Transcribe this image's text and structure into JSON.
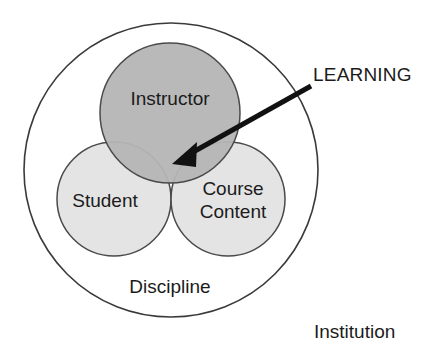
{
  "diagram": {
    "colors": {
      "background": "#ffffff",
      "outline": "#3a3a3a",
      "instructor_fill": "#b5b5b5",
      "student_fill": "#dedede",
      "course_fill": "#dedede",
      "arrow": "#111111",
      "text": "#1b1b1b"
    },
    "circles": [
      {
        "id": "instructor",
        "label": "Instructor",
        "cx": 170,
        "cy": 113,
        "r": 70,
        "fill": "#b5b5b5",
        "label_x": 170,
        "label_y": 100
      },
      {
        "id": "student",
        "label": "Student",
        "cx": 114,
        "cy": 199,
        "r": 57,
        "fill": "#dedede",
        "label_x": 105,
        "label_y": 202
      },
      {
        "id": "course-content",
        "label_line1": "Course",
        "label_line2": "Content",
        "cx": 228,
        "cy": 199,
        "r": 57,
        "fill": "#dedede",
        "label_x": 233,
        "label_y": 192
      }
    ],
    "outer_circle": {
      "id": "discipline",
      "label": "Discipline",
      "cx": 171,
      "cy": 170,
      "r": 147,
      "label_x": 170,
      "label_y": 288
    },
    "outside_label": {
      "id": "institution",
      "label": "Institution",
      "x": 314,
      "y": 333
    },
    "annotation": {
      "id": "learning",
      "label": "LEARNING",
      "text_x": 313,
      "text_y": 76,
      "arrow_start_x": 311,
      "arrow_start_y": 86,
      "arrow_tip_x": 172,
      "arrow_tip_y": 164
    }
  }
}
